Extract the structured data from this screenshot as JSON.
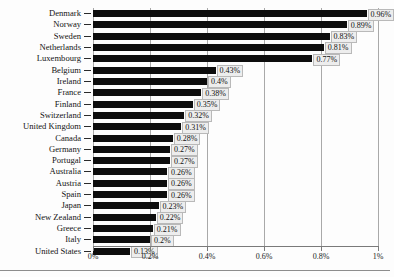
{
  "chart_data": {
    "type": "bar",
    "orientation": "horizontal",
    "title": "",
    "xlabel": "",
    "ylabel": "",
    "xlim": [
      0,
      1
    ],
    "grid": true,
    "legend": false,
    "xtick_labels": [
      "0%",
      "0.2%",
      "0.4%",
      "0.6%",
      "0.8%",
      "1%"
    ],
    "xtick_values": [
      0,
      0.2,
      0.4,
      0.6,
      0.8,
      1
    ],
    "categories": [
      "Denmark",
      "Norway",
      "Sweden",
      "Netherlands",
      "Luxembourg",
      "Belgium",
      "Ireland",
      "France",
      "Finland",
      "Switzerland",
      "United Kingdom",
      "Canada",
      "Germany",
      "Portugal",
      "Australia",
      "Austria",
      "Spain",
      "Japan",
      "New Zealand",
      "Greece",
      "Italy",
      "United States"
    ],
    "values": [
      0.96,
      0.89,
      0.83,
      0.81,
      0.77,
      0.43,
      0.4,
      0.38,
      0.35,
      0.32,
      0.31,
      0.28,
      0.27,
      0.27,
      0.26,
      0.26,
      0.26,
      0.23,
      0.22,
      0.21,
      0.2,
      0.13
    ],
    "data_labels": [
      "0.96%",
      "0.89%",
      "0.83%",
      "0.81%",
      "0.77%",
      "0.43%",
      "0.4%",
      "0.38%",
      "0.35%",
      "0.32%",
      "0.31%",
      "0.28%",
      "0.27%",
      "0.27%",
      "0.26%",
      "0.26%",
      "0.26%",
      "0.23%",
      "0.22%",
      "0.21%",
      "0.2%",
      "0.13%"
    ],
    "colors": {
      "bar": "#0d0d0d",
      "gridline": "#a9a9a9",
      "axis": "#7a7a7a",
      "label_box_fill": "#ededed",
      "label_box_border": "#b9b9b9",
      "background": "#fdfdfd"
    }
  }
}
